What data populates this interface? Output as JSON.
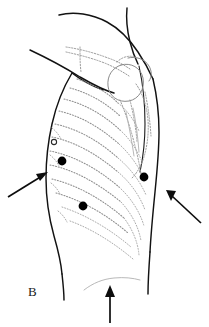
{
  "figure": {
    "panel_label": "B",
    "kind": "anatomical-line-drawing",
    "background_color": "#ffffff",
    "ink_color": "#121212",
    "rib_color": "#8e8e8e",
    "marker_color": "#000000"
  },
  "markers": {
    "dots": [
      {
        "name": "marker-dot-upper-left",
        "cx": 62,
        "cy": 161,
        "r": 4.4
      },
      {
        "name": "marker-dot-right",
        "cx": 144,
        "cy": 177,
        "r": 4.4
      },
      {
        "name": "marker-dot-lower-left",
        "cx": 83,
        "cy": 206,
        "r": 4.4
      }
    ],
    "rings": [
      {
        "name": "marker-ring-left-edge",
        "cx": 54,
        "cy": 142,
        "r": 2.6
      }
    ]
  },
  "arrows": [
    {
      "name": "arrow-left",
      "direction": "up-right",
      "tail": {
        "x": 8,
        "y": 197
      },
      "tip": {
        "x": 48,
        "y": 172
      }
    },
    {
      "name": "arrow-right",
      "direction": "up-left",
      "tail": {
        "x": 201,
        "y": 223
      },
      "tip": {
        "x": 166,
        "y": 190
      }
    },
    {
      "name": "arrow-bottom",
      "direction": "up",
      "tail": {
        "x": 110,
        "y": 323
      },
      "tip": {
        "x": 110,
        "y": 285
      }
    }
  ]
}
